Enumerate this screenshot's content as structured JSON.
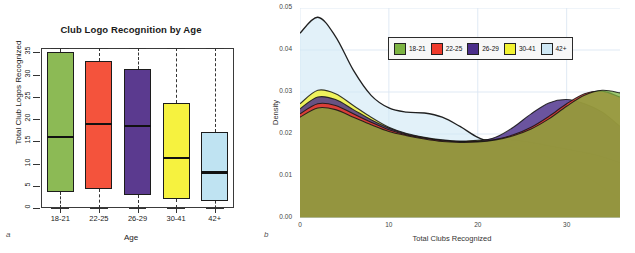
{
  "figure": {
    "panel_a_label": "a",
    "panel_b_label": "b"
  },
  "panel_a": {
    "title": "Club Logo Recognition by Age",
    "ylabel": "Total Club Logos Recognized",
    "xlabel": "Age"
  },
  "panel_b": {
    "ylabel": "Density",
    "xlabel": "Total Clubs Recognized"
  },
  "chart_data": [
    {
      "type": "boxplot",
      "title": "Club Logo Recognition by Age",
      "xlabel": "Age",
      "ylabel": "Total Club Logos Recognized",
      "categories": [
        "18-21",
        "22-25",
        "26-29",
        "30-41",
        "42+"
      ],
      "ylim": [
        0,
        36
      ],
      "yticks": [
        "0",
        "5",
        "10",
        "15",
        "20",
        "25",
        "30",
        "35"
      ],
      "grid": false,
      "colors": [
        "#8cba55",
        "#f4533c",
        "#5b3a8f",
        "#f6f23f",
        "#bfe3f2"
      ],
      "boxes": [
        {
          "category": "18-21",
          "color": "#8cba55",
          "lower_whisker": 0,
          "q1": 3.5,
          "median": 16.0,
          "q3": 35.0,
          "upper_whisker": 36
        },
        {
          "category": "22-25",
          "color": "#f4533c",
          "lower_whisker": 0,
          "q1": 4.2,
          "median": 19.0,
          "q3": 33.0,
          "upper_whisker": 36
        },
        {
          "category": "26-29",
          "color": "#5b3a8f",
          "lower_whisker": 0,
          "q1": 3.0,
          "median": 18.5,
          "q3": 31.2,
          "upper_whisker": 36
        },
        {
          "category": "30-41",
          "color": "#f6f23f",
          "lower_whisker": 0,
          "q1": 2.0,
          "median": 11.2,
          "q3": 23.7,
          "upper_whisker": 36
        },
        {
          "category": "42+",
          "color": "#bfe3f2",
          "lower_whisker": 0,
          "q1": 1.5,
          "median": 8.0,
          "q3": 17.2,
          "upper_whisker": 36
        }
      ]
    },
    {
      "type": "area",
      "subtype": "kernel-density",
      "title": "",
      "xlabel": "Total Clubs Recognized",
      "ylabel": "Density",
      "xlim": [
        0,
        36
      ],
      "ylim": [
        0,
        0.05
      ],
      "xticks": [
        "0",
        "10",
        "20",
        "30"
      ],
      "yticks": [
        "0.00",
        "0.01",
        "0.02",
        "0.03",
        "0.04",
        "0.05"
      ],
      "grid": true,
      "legend_position": "top-center",
      "legend": [
        "18-21",
        "22-25",
        "26-29",
        "30-41",
        "42+"
      ],
      "legend_colors": [
        "#7cb342",
        "#ef3b2c",
        "#4b2e8a",
        "#f2f231",
        "#cfe8f5"
      ],
      "x": [
        0,
        2,
        4,
        6,
        8,
        10,
        12,
        14,
        16,
        18,
        20,
        22,
        24,
        26,
        28,
        30,
        32,
        34,
        36
      ],
      "series": [
        {
          "name": "18-21",
          "color": "#7cb342",
          "values": [
            0.024,
            0.0262,
            0.0258,
            0.024,
            0.0222,
            0.0206,
            0.0196,
            0.0188,
            0.0182,
            0.018,
            0.0181,
            0.0186,
            0.0196,
            0.0212,
            0.0236,
            0.0266,
            0.0292,
            0.0304,
            0.0298
          ]
        },
        {
          "name": "22-25",
          "color": "#ef3b2c",
          "values": [
            0.0248,
            0.0272,
            0.0268,
            0.0248,
            0.0228,
            0.021,
            0.0198,
            0.019,
            0.0184,
            0.0181,
            0.0182,
            0.0187,
            0.0198,
            0.0216,
            0.0242,
            0.0272,
            0.0296,
            0.0302,
            0.0288
          ]
        },
        {
          "name": "26-29",
          "color": "#4b2e8a",
          "values": [
            0.026,
            0.0288,
            0.0282,
            0.0258,
            0.0234,
            0.0214,
            0.02,
            0.0191,
            0.0185,
            0.0182,
            0.0183,
            0.0192,
            0.0216,
            0.0248,
            0.0274,
            0.0282,
            0.0272,
            0.0252,
            0.0218
          ]
        },
        {
          "name": "30-41",
          "color": "#f2f231",
          "values": [
            0.0272,
            0.0304,
            0.0296,
            0.0268,
            0.024,
            0.0216,
            0.0201,
            0.0192,
            0.0186,
            0.0183,
            0.0185,
            0.0188,
            0.0186,
            0.018,
            0.0172,
            0.0164,
            0.0156,
            0.0146,
            0.0132
          ]
        },
        {
          "name": "42+",
          "color": "#cfe8f5",
          "values": [
            0.044,
            0.0478,
            0.0432,
            0.0352,
            0.0292,
            0.0262,
            0.0252,
            0.025,
            0.024,
            0.0218,
            0.0192,
            0.0178,
            0.0168,
            0.0158,
            0.0144,
            0.0126,
            0.0102,
            0.0074,
            0.0046
          ]
        }
      ]
    }
  ]
}
